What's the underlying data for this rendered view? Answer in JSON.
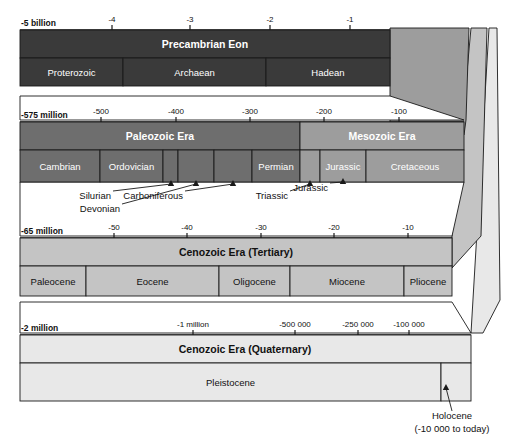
{
  "figure": {
    "type": "timeline"
  },
  "colors": {
    "precambrian": "#3a3a3a",
    "paleozoic": "#6e6e6e",
    "mesozoic": "#9d9d9d",
    "tertiary": "#c4c4c4",
    "quaternary": "#e8e8e8",
    "connector_1": "#9d9d9d",
    "connector_2": "#c4c4c4",
    "connector_3": "#e8e8e8",
    "stroke": "#1a1a1a",
    "text_light": "#ffffff",
    "text_dark": "#111111",
    "background": "#ffffff"
  },
  "bands": [
    {
      "id": "precambrian",
      "era_label": "Precambrian Eon",
      "axis_start_label": "-5 billion",
      "ticks": [
        {
          "label": "-4",
          "x": 112
        },
        {
          "label": "-3",
          "x": 190
        },
        {
          "label": "-2",
          "x": 270
        },
        {
          "label": "-1",
          "x": 350
        }
      ],
      "subdivisions": [
        {
          "label": "Proterozoic",
          "x0": 20,
          "x1": 123
        },
        {
          "label": "Archaean",
          "x0": 123,
          "x1": 266
        },
        {
          "label": "Hadean",
          "x0": 266,
          "x1": 390
        }
      ]
    },
    {
      "id": "paleozoic-mesozoic",
      "era_labels": [
        {
          "label": "Paleozoic Era",
          "x0": 20,
          "x1": 300
        },
        {
          "label": "Mesozoic Era",
          "x0": 300,
          "x1": 464
        }
      ],
      "axis_start_label": "-575 million",
      "ticks": [
        {
          "label": "-500",
          "x": 101
        },
        {
          "label": "-400",
          "x": 176
        },
        {
          "label": "-300",
          "x": 250
        },
        {
          "label": "-200",
          "x": 324
        },
        {
          "label": "-100",
          "x": 399
        }
      ],
      "subdivisions": [
        {
          "label": "Cambrian",
          "x0": 20,
          "x1": 100
        },
        {
          "label": "Ordovician",
          "x0": 100,
          "x1": 163
        },
        {
          "label": "Silurian",
          "x0": 163,
          "x1": 178
        },
        {
          "label": "Devonian",
          "x0": 178,
          "x1": 214
        },
        {
          "label": "Carboniferous",
          "x0": 214,
          "x1": 252
        },
        {
          "label": "Permian",
          "x0": 252,
          "x1": 300
        },
        {
          "label": "Triassic",
          "x0": 300,
          "x1": 320
        },
        {
          "label": "Jurassic",
          "x0": 320,
          "x1": 366
        },
        {
          "label": "Cretaceous",
          "x0": 366,
          "x1": 464
        }
      ],
      "callouts": [
        {
          "label": "Silurian",
          "text_x": 111,
          "text_y": 199,
          "tip_x": 171,
          "tip_y": 180
        },
        {
          "label": "Devonian",
          "text_x": 120,
          "text_y": 212,
          "tip_x": 196,
          "tip_y": 180
        },
        {
          "label": "Carboniferous",
          "text_x": 183,
          "text_y": 199,
          "tip_x": 233,
          "tip_y": 180
        },
        {
          "label": "Triassic",
          "text_x": 288,
          "text_y": 199,
          "tip_x": 310,
          "tip_y": 180
        },
        {
          "label": "Jurassic",
          "text_x": 328,
          "text_y": 191,
          "tip_x": 343,
          "tip_y": 178
        }
      ]
    },
    {
      "id": "tertiary",
      "era_label": "Cenozoic Era (Tertiary)",
      "axis_start_label": "-65 million",
      "ticks": [
        {
          "label": "-50",
          "x": 114
        },
        {
          "label": "-40",
          "x": 187
        },
        {
          "label": "-30",
          "x": 261
        },
        {
          "label": "-20",
          "x": 334
        },
        {
          "label": "-10",
          "x": 408
        }
      ],
      "subdivisions": [
        {
          "label": "Paleocene",
          "x0": 20,
          "x1": 86
        },
        {
          "label": "Eocene",
          "x0": 86,
          "x1": 219
        },
        {
          "label": "Oligocene",
          "x0": 219,
          "x1": 290
        },
        {
          "label": "Miocene",
          "x0": 290,
          "x1": 404
        },
        {
          "label": "Pliocene",
          "x0": 404,
          "x1": 452
        }
      ]
    },
    {
      "id": "quaternary",
      "era_label": "Cenozoic Era (Quaternary)",
      "axis_start_label": "-2 million",
      "ticks": [
        {
          "label": "-1 million",
          "x": 193
        },
        {
          "label": "-500 000",
          "x": 295
        },
        {
          "label": "-250 000",
          "x": 358
        },
        {
          "label": "-100 000",
          "x": 409
        }
      ],
      "subdivisions": [
        {
          "label": "Pleistocene",
          "x0": 20,
          "x1": 441
        }
      ],
      "callouts": [
        {
          "label": "Holocene",
          "sub": "(-10 000 to today)",
          "text_x": 452,
          "text_y": 419,
          "tip_x": 446,
          "tip_y": 384
        }
      ]
    }
  ]
}
